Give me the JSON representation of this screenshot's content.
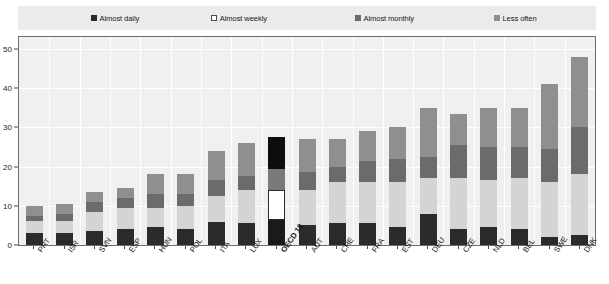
{
  "legend": {
    "items": [
      {
        "label": "Almost daily",
        "color": "#2b2b2b",
        "key": "almost_daily"
      },
      {
        "label": "Almost weekly",
        "color": "#ffffff",
        "key": "almost_weekly"
      },
      {
        "label": "Almost monthly",
        "color": "#6b6b6b",
        "key": "almost_monthly"
      },
      {
        "label": "Less often",
        "color": "#8f8f8f",
        "key": "less_often"
      }
    ]
  },
  "axes": {
    "y_ticks": [
      "0",
      "10",
      "20",
      "30",
      "40",
      "50"
    ],
    "y_min": 0,
    "y_max": 53,
    "x_labels": [
      "PRT",
      "ISR",
      "SVN",
      "ESP",
      "HUN",
      "POL",
      "ITA",
      "LUX",
      "OECD 18",
      "AUT",
      "CHE",
      "FRA",
      "EST",
      "DEU",
      "CZE",
      "NLD",
      "BEL",
      "SWE",
      "DNK"
    ]
  },
  "highlight": {
    "category": "OECD 18",
    "colors": {
      "almost_daily": "#1a1a1a",
      "almost_weekly": "#ffffff",
      "almost_monthly": "#7a7a7a",
      "less_often": "#0d0d0d"
    }
  },
  "chart_data": {
    "type": "bar",
    "stacked": true,
    "title": "",
    "subtitle": "",
    "xlabel": "",
    "ylabel": "",
    "ylim": [
      0,
      53
    ],
    "grid": true,
    "legend_position": "top",
    "categories": [
      "PRT",
      "ISR",
      "SVN",
      "ESP",
      "HUN",
      "POL",
      "ITA",
      "LUX",
      "OECD 18",
      "AUT",
      "CHE",
      "FRA",
      "EST",
      "DEU",
      "CZE",
      "NLD",
      "BEL",
      "SWE",
      "DNK"
    ],
    "series": [
      {
        "name": "Almost daily",
        "color": "#2b2b2b",
        "values": [
          3.0,
          3.0,
          3.5,
          4.0,
          4.5,
          4.0,
          6.0,
          5.5,
          6.5,
          5.0,
          5.5,
          5.5,
          4.5,
          8.0,
          4.0,
          4.5,
          4.0,
          2.0,
          2.5
        ]
      },
      {
        "name": "Almost weekly",
        "color": "#d4d4d4",
        "values": [
          3.0,
          3.0,
          5.0,
          5.5,
          5.0,
          6.0,
          6.5,
          8.5,
          7.5,
          9.0,
          10.5,
          10.5,
          11.5,
          9.0,
          13.0,
          12.0,
          13.0,
          14.0,
          15.5
        ]
      },
      {
        "name": "Almost monthly",
        "color": "#6b6b6b",
        "values": [
          1.5,
          2.0,
          2.5,
          2.5,
          3.5,
          3.0,
          4.0,
          3.5,
          5.5,
          4.5,
          4.0,
          5.5,
          6.0,
          5.5,
          8.5,
          8.5,
          8.0,
          8.5,
          12.0
        ]
      },
      {
        "name": "Less often",
        "color": "#8f8f8f",
        "values": [
          2.5,
          2.5,
          2.5,
          2.5,
          5.0,
          5.0,
          7.5,
          8.5,
          8.0,
          8.5,
          7.0,
          7.5,
          8.0,
          12.5,
          8.0,
          10.0,
          10.0,
          16.5,
          18.0
        ]
      }
    ],
    "totals": [
      10.0,
      10.5,
      13.5,
      14.5,
      18.0,
      18.0,
      24.0,
      26.0,
      27.5,
      27.0,
      27.0,
      29.0,
      30.0,
      33.5,
      33.5,
      35.0,
      35.0,
      41.0,
      48.0
    ]
  }
}
